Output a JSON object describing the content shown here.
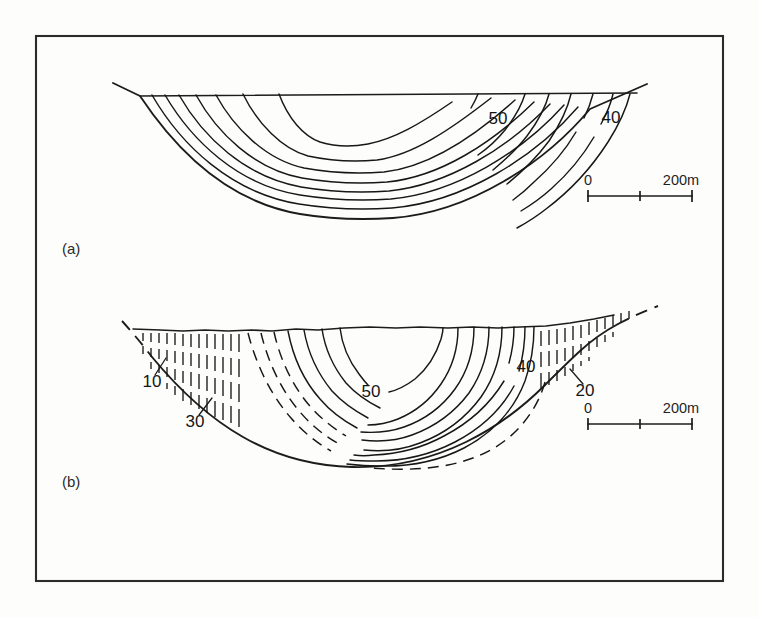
{
  "figure": {
    "type": "cross-section-contour-diagram",
    "background_color": "#fdfdfb",
    "line_color": "#171717",
    "frame": {
      "x": 35,
      "y": 35,
      "width": 687,
      "height": 545
    }
  },
  "panels": [
    {
      "id": "a",
      "label": "(a)",
      "label_x": 62,
      "label_y": 254,
      "description": "symmetric parabolic valley cross-section with nested ice-thickness contours",
      "contour_labels": [
        {
          "text": "50",
          "x": 498,
          "y": 124
        },
        {
          "text": "40",
          "x": 611,
          "y": 123
        }
      ],
      "scale_bar": {
        "start_label": "0",
        "end_label": "200m",
        "start_x": 587,
        "end_x": 693,
        "y": 196,
        "tick_count": 3
      }
    },
    {
      "id": "b",
      "label": "(b)",
      "label_x": 62,
      "label_y": 487,
      "description": "asymmetric valley cross-section with stippled sediment wedges and dashed buried contours",
      "contour_labels": [
        {
          "text": "50",
          "x": 371,
          "y": 397
        },
        {
          "text": "40",
          "x": 526,
          "y": 372
        },
        {
          "text": "20",
          "x": 585,
          "y": 396
        },
        {
          "text": "10",
          "x": 152,
          "y": 387
        },
        {
          "text": "30",
          "x": 195,
          "y": 427
        }
      ],
      "scale_bar": {
        "start_label": "0",
        "end_label": "200m",
        "start_x": 587,
        "end_x": 693,
        "y": 424,
        "tick_count": 3
      }
    }
  ],
  "chart_data": {
    "type": "line",
    "title": "",
    "subtitle": "",
    "xlabel": "",
    "ylabel": "",
    "grid": false,
    "legend_position": "none",
    "units": "metres",
    "contour_interval": 10,
    "series": [
      {
        "name": "panel-a-contours",
        "labelled_values": [
          50,
          40
        ],
        "contour_count": 9,
        "shape": "nested-parabolic-U"
      },
      {
        "name": "panel-b-contours",
        "labelled_values": [
          50,
          40,
          30,
          20,
          10
        ],
        "contour_count": 12,
        "shape": "asymmetric-flat-bottomed"
      }
    ],
    "annotations": [
      {
        "text": "(a)",
        "role": "panel-label"
      },
      {
        "text": "(b)",
        "role": "panel-label"
      },
      {
        "text": "200m",
        "role": "scale-length"
      },
      {
        "text": "0",
        "role": "scale-origin"
      }
    ]
  }
}
